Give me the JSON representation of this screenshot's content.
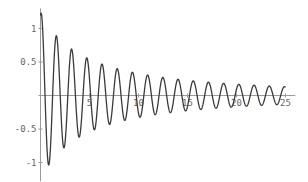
{
  "chart_data": {
    "type": "line",
    "title": "",
    "xlabel": "",
    "ylabel": "",
    "xlim": [
      0,
      25
    ],
    "ylim": [
      -1.2,
      1.25
    ],
    "grid": false,
    "legend": null,
    "x_ticks": [
      5,
      10,
      15,
      20,
      25
    ],
    "x_tick_labels": [
      "5",
      "10",
      "15",
      "20",
      "25"
    ],
    "y_ticks": [
      1,
      0.5,
      -0.5,
      -1
    ],
    "y_tick_labels": [
      "1",
      "0.5",
      "-0.5",
      "-1"
    ],
    "series": [
      {
        "name": "damped oscillation",
        "peaks_x": [
          0.15,
          1.7,
          3.25,
          4.8,
          6.35,
          7.9,
          9.45,
          11.0,
          12.55,
          14.1,
          15.65,
          17.2,
          18.75,
          20.3,
          21.85,
          23.4
        ],
        "peaks_y": [
          1.24,
          1.01,
          0.84,
          0.67,
          0.58,
          0.49,
          0.41,
          0.36,
          0.31,
          0.27,
          0.23,
          0.2,
          0.18,
          0.16,
          0.14,
          0.12
        ],
        "troughs_x": [
          0.9,
          2.45,
          4.0,
          5.55,
          7.1,
          8.65,
          10.2,
          11.75,
          13.3,
          14.85,
          16.4,
          17.95,
          19.5,
          21.05,
          22.6,
          24.15
        ],
        "troughs_y": [
          -1.1,
          -0.92,
          -0.76,
          -0.63,
          -0.54,
          -0.45,
          -0.38,
          -0.33,
          -0.29,
          -0.25,
          -0.22,
          -0.19,
          -0.17,
          -0.15,
          -0.13,
          -0.12
        ]
      }
    ],
    "model": {
      "omega": 4.05,
      "phase": -0.3,
      "amp0": 1.25,
      "decay_a": 0.24,
      "decay_b": 0.004
    }
  },
  "colors": {
    "curve": "#3a3a3a",
    "axis": "#9a9a9a",
    "text": "#666666",
    "background": "#ffffff"
  }
}
